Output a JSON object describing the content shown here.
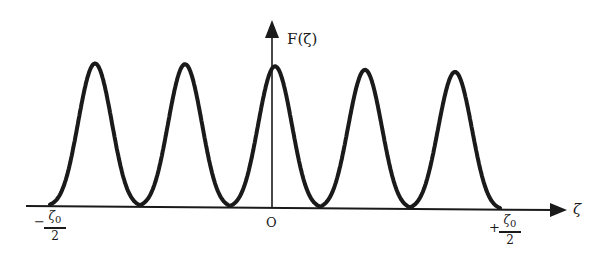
{
  "chart_data": {
    "type": "line",
    "title": "",
    "xlabel": "ζ",
    "ylabel": "F(ζ)",
    "x_ticks": [
      {
        "label": "−ζ0/2",
        "sign": "−",
        "num": "ζ",
        "sub": "0",
        "den": "2",
        "position": -0.5
      },
      {
        "label": "O",
        "position": 0
      },
      {
        "label": "+ζ0/2",
        "sign": "+",
        "num": "ζ",
        "sub": "0",
        "den": "2",
        "position": 0.5
      }
    ],
    "grid": false,
    "legend": null,
    "xlim": [
      -0.5,
      0.5
    ],
    "ylim": [
      0,
      1
    ],
    "x": [
      -0.5,
      -0.4,
      -0.3,
      -0.2,
      -0.1,
      0,
      0.1,
      0.2,
      0.3,
      0.4,
      0.5
    ],
    "values": [
      0,
      1.0,
      0,
      1.0,
      0,
      0.99,
      0,
      0.97,
      0,
      0.96,
      0
    ],
    "peaks": [
      {
        "x": -0.4,
        "y": 1.0
      },
      {
        "x": -0.2,
        "y": 1.0
      },
      {
        "x": 0.0,
        "y": 0.99
      },
      {
        "x": 0.2,
        "y": 0.97
      },
      {
        "x": 0.4,
        "y": 0.96
      }
    ],
    "line_color": "#1a1a1a"
  },
  "labels": {
    "y_axis": "F(ζ)",
    "x_axis": "ζ",
    "origin": "O",
    "left_sign": "−",
    "right_sign": "+",
    "frac_num": "ζ",
    "frac_sub": "0",
    "frac_den": "2"
  }
}
